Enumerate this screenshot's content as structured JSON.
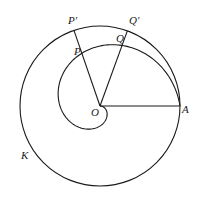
{
  "diagram": {
    "type": "archimedean-spiral-in-circle",
    "stroke_color": "#1a1a1a",
    "background": "#ffffff",
    "circle": {
      "name": "K",
      "cx": 100,
      "cy": 106,
      "r": 80
    },
    "spiral": {
      "origin": "O",
      "end": "A",
      "turns": 1
    },
    "segments": [
      {
        "from": "O",
        "to": "A"
      },
      {
        "from": "O",
        "to": "P'"
      },
      {
        "from": "O",
        "to": "Q'"
      }
    ],
    "rays": {
      "P_angle_deg": 109,
      "Q_angle_deg": 70
    },
    "labels": {
      "O": "O",
      "A": "A",
      "P": "P",
      "Q": "Q",
      "P_prime": "P'",
      "Q_prime": "Q'",
      "K": "K"
    }
  }
}
